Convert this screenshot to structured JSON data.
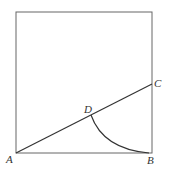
{
  "diagram": {
    "labels": {
      "A": "A",
      "B": "B",
      "C": "C",
      "D": "D"
    },
    "points": {
      "A": [
        16,
        153
      ],
      "B": [
        152,
        153
      ],
      "C": [
        152,
        84
      ],
      "D": [
        91,
        115
      ]
    },
    "square": {
      "x": 16,
      "y": 12,
      "size": 137
    },
    "colors": {
      "stroke": "#444444",
      "background": "#ffffff"
    }
  }
}
